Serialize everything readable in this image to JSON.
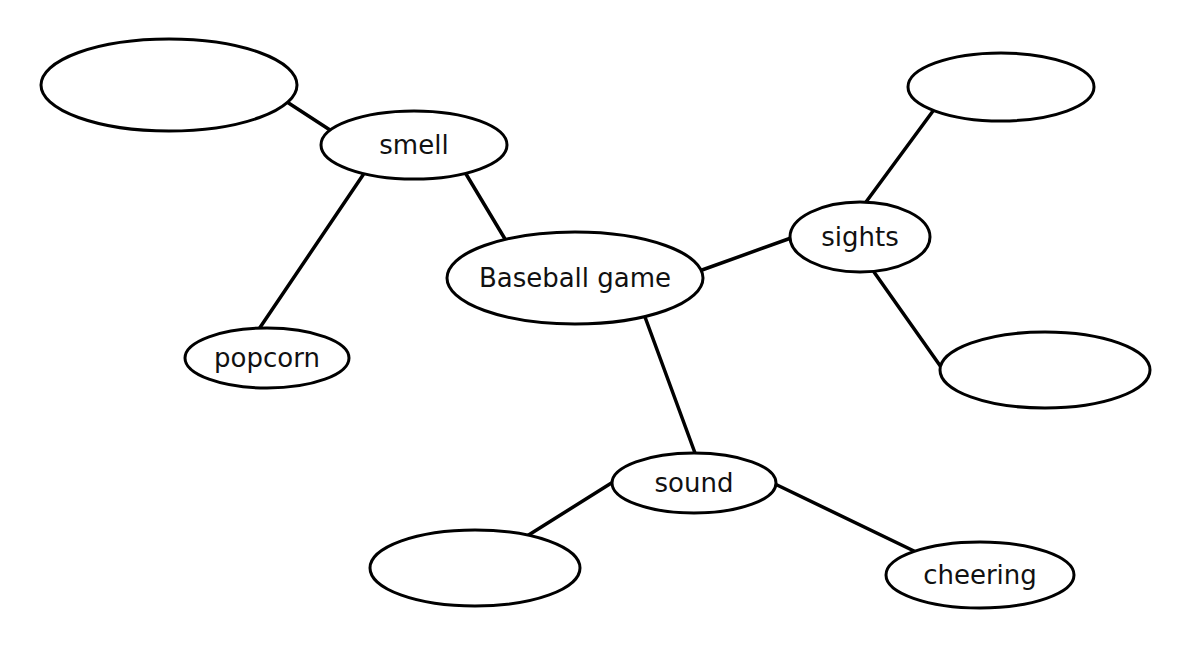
{
  "diagram": {
    "type": "web-organizer",
    "colors": {
      "stroke": "#000000",
      "fill": "#ffffff",
      "text": "#111111"
    },
    "nodes": [
      {
        "id": "center",
        "label": "Baseball game",
        "cx": 575,
        "cy": 278,
        "rx": 128,
        "ry": 46
      },
      {
        "id": "smell",
        "label": "smell",
        "cx": 414,
        "cy": 145,
        "rx": 93,
        "ry": 34
      },
      {
        "id": "sights",
        "label": "sights",
        "cx": 860,
        "cy": 237,
        "rx": 70,
        "ry": 35
      },
      {
        "id": "sound",
        "label": "sound",
        "cx": 694,
        "cy": 483,
        "rx": 82,
        "ry": 30
      },
      {
        "id": "smell-blank",
        "label": "",
        "cx": 169,
        "cy": 85,
        "rx": 128,
        "ry": 46
      },
      {
        "id": "popcorn",
        "label": "popcorn",
        "cx": 267,
        "cy": 358,
        "rx": 82,
        "ry": 30
      },
      {
        "id": "sights-blank-top",
        "label": "",
        "cx": 1001,
        "cy": 87,
        "rx": 93,
        "ry": 34
      },
      {
        "id": "sights-blank-bottom",
        "label": "",
        "cx": 1045,
        "cy": 370,
        "rx": 105,
        "ry": 38
      },
      {
        "id": "sound-blank",
        "label": "",
        "cx": 475,
        "cy": 568,
        "rx": 105,
        "ry": 38
      },
      {
        "id": "cheering",
        "label": "cheering",
        "cx": 980,
        "cy": 575,
        "rx": 94,
        "ry": 33
      }
    ],
    "edges": [
      {
        "from": "smell",
        "to": "center",
        "x1": 466,
        "y1": 174,
        "x2": 505,
        "y2": 239
      },
      {
        "from": "center",
        "to": "sights",
        "x1": 702,
        "y1": 270,
        "x2": 791,
        "y2": 238
      },
      {
        "from": "center",
        "to": "sound",
        "x1": 645,
        "y1": 317,
        "x2": 695,
        "y2": 453
      },
      {
        "from": "smell-blank",
        "to": "smell",
        "x1": 287,
        "y1": 102,
        "x2": 330,
        "y2": 130
      },
      {
        "from": "smell",
        "to": "popcorn",
        "x1": 363,
        "y1": 175,
        "x2": 259,
        "y2": 329
      },
      {
        "from": "sights",
        "to": "sights-blank-top",
        "x1": 866,
        "y1": 202,
        "x2": 933,
        "y2": 111
      },
      {
        "from": "sights",
        "to": "sights-blank-bottom",
        "x1": 874,
        "y1": 272,
        "x2": 941,
        "y2": 367
      },
      {
        "from": "sound",
        "to": "sound-blank",
        "x1": 613,
        "y1": 482,
        "x2": 527,
        "y2": 536
      },
      {
        "from": "sound",
        "to": "cheering",
        "x1": 775,
        "y1": 484,
        "x2": 914,
        "y2": 551
      }
    ]
  }
}
